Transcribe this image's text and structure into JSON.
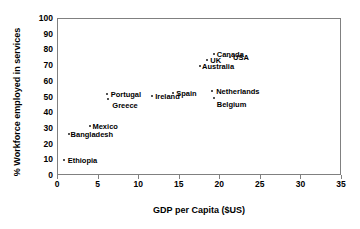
{
  "chart_data": {
    "type": "scatter",
    "title": "",
    "xlabel": "GDP per Capita ($US)",
    "ylabel": "% Workforce employed in services",
    "xlim": [
      0,
      35
    ],
    "ylim": [
      0,
      100
    ],
    "xticks": [
      0,
      5,
      10,
      15,
      20,
      25,
      30,
      35
    ],
    "yticks": [
      0,
      10,
      20,
      30,
      40,
      50,
      60,
      70,
      80,
      90,
      100
    ],
    "grid": false,
    "legend": "none",
    "marker_color": "#555555",
    "frame_color": "#808080",
    "points": [
      {
        "label": "Ethiopia",
        "x": 0.7,
        "y": 10,
        "label_dx": 4,
        "label_dy": -4
      },
      {
        "label": "Bangladesh",
        "x": 1.3,
        "y": 27,
        "label_dx": 2,
        "label_dy": -4
      },
      {
        "label": "Mexico",
        "x": 4.0,
        "y": 32,
        "label_dx": 2,
        "label_dy": -4
      },
      {
        "label": "Greece",
        "x": 6.2,
        "y": 49,
        "label_dx": 4,
        "label_dy": 2
      },
      {
        "label": "Portugal",
        "x": 6.0,
        "y": 52,
        "label_dx": 4,
        "label_dy": -4
      },
      {
        "label": "Ireland",
        "x": 11.6,
        "y": 51,
        "label_dx": 3,
        "label_dy": -4
      },
      {
        "label": "Spain",
        "x": 14.2,
        "y": 53,
        "label_dx": 3,
        "label_dy": -4
      },
      {
        "label": "Australia",
        "x": 17.5,
        "y": 70,
        "label_dx": 2,
        "label_dy": -4
      },
      {
        "label": "UK",
        "x": 18.4,
        "y": 74,
        "label_dx": 3,
        "label_dy": -4
      },
      {
        "label": "Canada",
        "x": 19.2,
        "y": 78,
        "label_dx": 3,
        "label_dy": -4
      },
      {
        "label": "USA",
        "x": 21.2,
        "y": 76,
        "label_dx": 3,
        "label_dy": -4
      },
      {
        "label": "Belgium",
        "x": 19.2,
        "y": 50,
        "label_dx": 3,
        "label_dy": 2
      },
      {
        "label": "Netherlands",
        "x": 19.0,
        "y": 54,
        "label_dx": 4,
        "label_dy": -4
      }
    ]
  }
}
